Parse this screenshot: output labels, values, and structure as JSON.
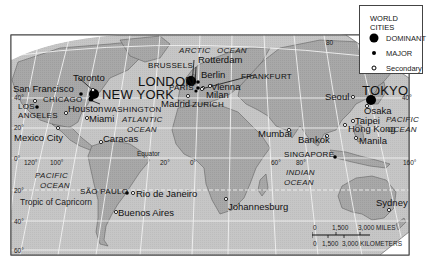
{
  "legend": {
    "title": "WORLD CITIES",
    "items": [
      {
        "label": "DOMINANT",
        "symbol": "large-filled-dot"
      },
      {
        "label": "MAJOR",
        "symbol": "small-filled-dot"
      },
      {
        "label": "Secondary",
        "symbol": "hollow-circle"
      }
    ]
  },
  "cities": {
    "dominant": [
      "NEW YORK",
      "LONDON",
      "TOKYO"
    ],
    "major": [
      "CHICAGO",
      "LOS ANGELES",
      "WASHINGTON",
      "BRUSSELS",
      "PARIS",
      "FRANKFURT",
      "ZURICH",
      "SÃO PAULO",
      "SINGAPORE"
    ],
    "secondary": [
      "San Francisco",
      "Toronto",
      "Houston",
      "Miami",
      "Mexico City",
      "Caracas",
      "Rio de Janeiro",
      "Buenos Aires",
      "Madrid",
      "Rotterdam",
      "Berlin",
      "Vienna",
      "Milan",
      "Johannesburg",
      "Mumbai",
      "Bankok",
      "Seoul",
      "Osaka",
      "Taipei",
      "Hong Kong",
      "Manila",
      "Sydney"
    ]
  },
  "labels": {
    "new_york": "NEW YORK",
    "london": "LONDON",
    "tokyo": "TOKYO",
    "chicago": "CHICAGO",
    "los": "LOS",
    "angeles": "ANGELES",
    "washington": "WASHINGTON",
    "brussels": "BRUSSELS",
    "paris": "PARIS",
    "frankfurt": "FRANKFURT",
    "zurich": "ZURICH",
    "sao_paulo": "SÃO PAULO",
    "singapore": "SINGAPORE",
    "san_francisco": "San Francisco",
    "toronto": "Toronto",
    "houston": "Houston",
    "miami": "Miami",
    "mexico_city": "Mexico City",
    "caracas": "Caracas",
    "rio": "Rio de Janeiro",
    "buenos_aires": "Buenos Aires",
    "madrid": "Madrid",
    "rotterdam": "Rotterdam",
    "berlin": "Berlin",
    "vienna": "Vienna",
    "milan": "Milan",
    "johannesburg": "Johannesburg",
    "mumbai": "Mumbai",
    "bankok": "Bankok",
    "seoul": "Seoul",
    "osaka": "Osaka",
    "taipei": "Taipei",
    "hong_kong": "Hong Kong",
    "manila": "Manila",
    "sydney": "Sydney"
  },
  "oceans": {
    "arctic": "ARCTIC",
    "arctic_ocean": "OCEAN",
    "atlantic": "ATLANTIC",
    "atlantic_ocean": "OCEAN",
    "pacific_w": "PACIFIC",
    "pacific_w_ocean": "OCEAN",
    "pacific_e": "PACIFIC",
    "pacific_e_ocean": "OCEAN",
    "indian": "INDIAN",
    "indian_ocean": "OCEAN"
  },
  "reference_lines": {
    "equator": "Equator",
    "tropic_capricorn": "Tropic of Capricorn"
  },
  "graticule": {
    "lat_40n": "40°",
    "lat_20n": "20°",
    "lat_0": "0°",
    "lat_20s": "20°",
    "lat_40s": "40°",
    "lat_60s": "60°",
    "lat_40n_e": "40°",
    "lon_120w": "120°",
    "lon_100w": "100°",
    "lon_20w": "20°",
    "lon_0": "0°",
    "lon_60e": "60°",
    "lon_80e": "80°",
    "lon_160e": "160°",
    "lon_80_top": "80"
  },
  "scale_bar": {
    "miles_0": "0",
    "miles_1500": "1,500",
    "miles_3000": "3,000 MILES",
    "km_0": "0",
    "km_1500": "1,500",
    "km_3000": "3,000 KILOMETERS"
  },
  "colors": {
    "ocean": "#c9c9c9",
    "land": "#a9a9a9",
    "grid": "#f2f2f2",
    "border": "#444444",
    "text": "#111111"
  }
}
